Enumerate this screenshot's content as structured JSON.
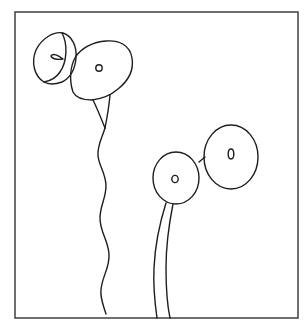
{
  "drawing": {
    "description": "Line sketch of poppy-like flowers in a square frame",
    "stroke_color": "#1e1e1e",
    "frame_color": "#4a4a4a",
    "background": "#ffffff",
    "frame": {
      "x": 15,
      "y": 12,
      "width": 283,
      "height": 306
    },
    "flowers": [
      {
        "name": "upper-left-side-view-flower",
        "cx": 53,
        "cy": 65
      },
      {
        "name": "upper-center-flower",
        "cx": 98,
        "cy": 68
      },
      {
        "name": "lower-middle-flower",
        "cx": 176,
        "cy": 177
      },
      {
        "name": "lower-right-flower",
        "cx": 231,
        "cy": 157
      }
    ]
  }
}
